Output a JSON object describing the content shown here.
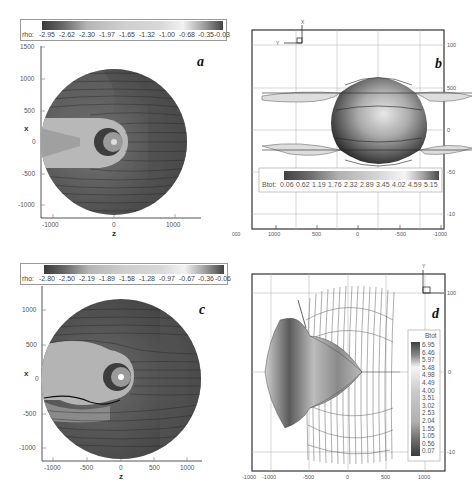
{
  "panels": {
    "a": {
      "letter": "a",
      "colorbar": {
        "variable": "rho:",
        "ticks": [
          "-2.95",
          "-2.62",
          "-2.30",
          "-1.97",
          "-1.65",
          "-1.32",
          "-1.00",
          "-0.68",
          "-0.35",
          "-0.03"
        ]
      },
      "xaxis": {
        "title": "z",
        "ticks": [
          "-1000",
          "0",
          "1000"
        ]
      },
      "yaxis": {
        "title": "x",
        "ticks": [
          "1500",
          "1000",
          "500",
          "0",
          "-500",
          "-1000"
        ]
      }
    },
    "b": {
      "letter": "b",
      "triad": {
        "up": "X",
        "left": "Y",
        "corner": "Z"
      },
      "colorbar": {
        "variable": "Btot:",
        "ticks": [
          "0.06",
          "0.62",
          "1.19",
          "1.76",
          "2.32",
          "2.89",
          "3.45",
          "4.02",
          "4.59",
          "5.15"
        ]
      },
      "xaxis": {
        "ticks": [
          "1000",
          "500",
          "0",
          "-500",
          "-1000"
        ],
        "cut_label": "000"
      },
      "yaxis_right": {
        "ticks": [
          "100",
          "500",
          "0",
          "-50",
          "-10"
        ]
      }
    },
    "c": {
      "letter": "c",
      "colorbar": {
        "variable": "rho:",
        "ticks": [
          "-2.80",
          "-2.50",
          "-2.19",
          "-1.89",
          "-1.58",
          "-1.28",
          "-0.97",
          "-0.67",
          "-0.36",
          "-0.06"
        ]
      },
      "xaxis": {
        "title": "z",
        "ticks": [
          "-1000",
          "-500",
          "0",
          "500",
          "1000"
        ]
      },
      "yaxis": {
        "title": "x",
        "ticks": [
          "1000",
          "500",
          "0",
          "-500",
          "-1000"
        ]
      }
    },
    "d": {
      "letter": "d",
      "triad": {
        "up": "Y"
      },
      "colorbar": {
        "variable": "Btot",
        "ticks": [
          "6.95",
          "6.46",
          "5.97",
          "5.48",
          "4.98",
          "4.49",
          "4.00",
          "3.51",
          "3.02",
          "2.53",
          "2.04",
          "1.55",
          "1.05",
          "0.56",
          "0.07"
        ]
      },
      "xaxis": {
        "ticks": [
          "-1000",
          "-1000",
          "-500",
          "0",
          "500",
          "1000"
        ]
      },
      "yaxis_right": {
        "ticks": [
          "100",
          "0",
          "-10"
        ]
      }
    }
  }
}
